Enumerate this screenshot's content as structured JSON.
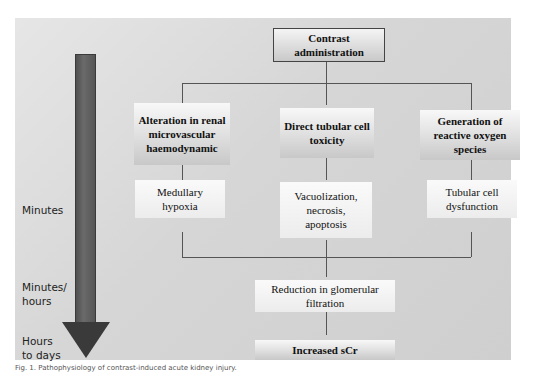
{
  "diagram": {
    "top_box": "Contrast administration",
    "timeline": {
      "labels": [
        "Minutes",
        "Minutes/ hours",
        "Hours to days"
      ]
    },
    "branches": [
      {
        "mechanism": "Alteration in renal microvascular haemodynamic",
        "effect": "Medullary hypoxia"
      },
      {
        "mechanism": "Direct tubular cell toxicity",
        "effect": "Vacuolization, necrosis, apoptosis"
      },
      {
        "mechanism": "Generation of reactive oxygen species",
        "effect": "Tubular cell dysfunction"
      }
    ],
    "convergence": "Reduction in glomerular filtration",
    "outcome": "Increased sCr"
  },
  "caption": "Fig. 1. Pathophysiology of contrast-induced acute kidney injury."
}
